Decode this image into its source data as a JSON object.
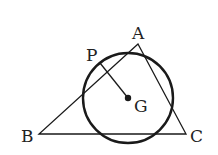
{
  "diagram": {
    "type": "geometry",
    "points": {
      "A": {
        "label": "A",
        "x": 138,
        "y": 44
      },
      "B": {
        "label": "B",
        "x": 39,
        "y": 134
      },
      "C": {
        "label": "C",
        "x": 186,
        "y": 134
      },
      "G": {
        "label": "G",
        "x": 128,
        "y": 98
      },
      "P": {
        "label": "P",
        "x": 100,
        "y": 64
      }
    },
    "circle": {
      "center": "G",
      "radius": 45
    },
    "segments": [
      [
        "A",
        "B"
      ],
      [
        "B",
        "C"
      ],
      [
        "C",
        "A"
      ],
      [
        "P",
        "G"
      ]
    ],
    "colors": {
      "stroke": "#1a1a1a",
      "background": "#ffffff"
    }
  }
}
